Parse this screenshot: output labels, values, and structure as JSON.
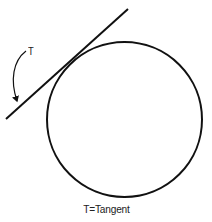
{
  "diagram": {
    "circle": {
      "cx": 124.5,
      "cy": 119.5,
      "r": 77.5,
      "stroke": "#111111",
      "stroke_width": 2
    },
    "tangent_line": {
      "x1": 128,
      "y1": 9,
      "x2": 6,
      "y2": 119,
      "stroke": "#111111",
      "stroke_width": 2
    },
    "pointer_arrow": {
      "label_ref": "T"
    },
    "labels": {
      "tangent_marker": "T",
      "caption": "T=Tangent"
    }
  }
}
